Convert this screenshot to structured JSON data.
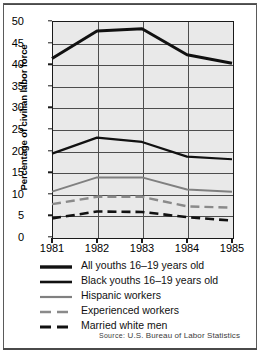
{
  "chart_data": {
    "type": "line",
    "title": "",
    "xlabel": "",
    "ylabel": "Percentage of civilian labor force",
    "x": [
      "1981",
      "1982",
      "1983",
      "1984",
      "1985"
    ],
    "categories": [
      "1981",
      "1982",
      "1983",
      "1984",
      "1985"
    ],
    "ylim": [
      0,
      50
    ],
    "xlim": [
      "1981",
      "1985"
    ],
    "yticks": [
      0,
      5,
      10,
      15,
      20,
      25,
      30,
      35,
      40,
      45,
      50
    ],
    "ytick_labels": [
      "0",
      "5",
      "10",
      "15",
      "20",
      "25",
      "30",
      "35",
      "40",
      "45",
      "50"
    ],
    "xtick_labels": [
      "1981",
      "1982",
      "1983",
      "1984",
      "1985"
    ],
    "grid": "horizontal-and-vertical",
    "legend_position": "below-plot",
    "series": [
      {
        "name": "Black youths 16–19 years old",
        "values": [
          41.3,
          47.7,
          48.2,
          42.2,
          40.2
        ],
        "color": "#111111",
        "width": 3.0,
        "dash": "none"
      },
      {
        "name": "All youths 16–19 years old",
        "values": [
          19.3,
          23.0,
          22.0,
          18.6,
          18.0
        ],
        "color": "#111111",
        "width": 2.2,
        "dash": "none"
      },
      {
        "name": "Hispanic workers",
        "values": [
          10.5,
          13.8,
          13.8,
          11.0,
          10.5
        ],
        "color": "#808080",
        "width": 2.0,
        "dash": "none"
      },
      {
        "name": "Experienced workers",
        "values": [
          7.6,
          9.3,
          9.3,
          7.1,
          6.8
        ],
        "color": "#8a8a8a",
        "width": 2.4,
        "dash": "9,5"
      },
      {
        "name": "Married white men",
        "values": [
          4.3,
          5.9,
          5.8,
          4.6,
          3.8
        ],
        "color": "#111111",
        "width": 2.6,
        "dash": "9,5"
      }
    ]
  },
  "legend": {
    "items": [
      {
        "label": "All youths 16–19 years old",
        "color": "#111111",
        "style": "solid-thick"
      },
      {
        "label": "Black youths 16–19 years old",
        "color": "#111111",
        "style": "solid-medium"
      },
      {
        "label": "Hispanic workers",
        "color": "#808080",
        "style": "solid-gray"
      },
      {
        "label": "Experienced workers",
        "color": "#8a8a8a",
        "style": "dashed-gray"
      },
      {
        "label": "Married white men",
        "color": "#111111",
        "style": "dashed-black"
      }
    ]
  },
  "source": {
    "prefix": "Source:",
    "text": "U.S. Bureau of Labor Statistics"
  },
  "colors": {
    "plot_background": "#e9e9e9",
    "axis": "#1a1a1a",
    "gridline": "#4d4d4d",
    "page_background": "#ffffff"
  }
}
